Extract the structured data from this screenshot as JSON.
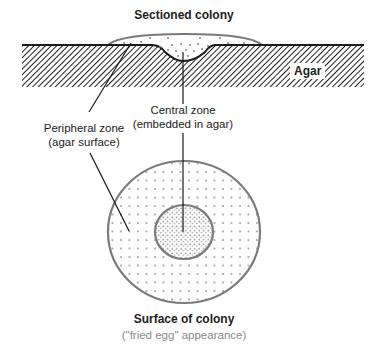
{
  "figure": {
    "top_title": "Sectioned colony",
    "agar_label": "Agar",
    "central_zone": {
      "line1": "Central zone",
      "line2": "(embedded in agar)"
    },
    "peripheral_zone": {
      "line1": "Peripheral zone",
      "line2": "(agar surface)"
    },
    "bottom_title": "Surface of colony",
    "bottom_subtitle": "(\"fried egg\" appearance)"
  },
  "colors": {
    "line": "#1a1a1a",
    "colony_outline": "#7a7a7a",
    "dots": "#777777",
    "hatch": "#222222",
    "subtitle": "#8a8a8a"
  },
  "icons": {
    "hatch_pattern": "diagonal-hatch",
    "colony_dots": "stipple-dots"
  }
}
